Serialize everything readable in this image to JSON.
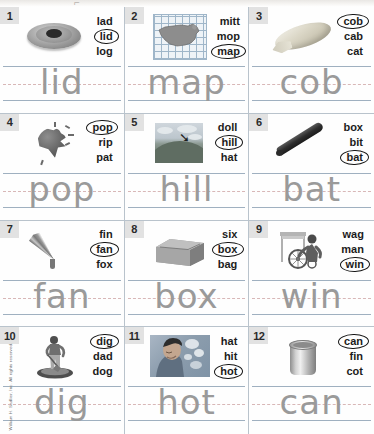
{
  "worksheet": {
    "copyright": "William H. Sadlier, Inc.  All rights reserved.",
    "row_colors": {
      "rule_line": "#9fb0c0",
      "dashed_mid_line": "#d8b7b7",
      "cell_border": "#b9c3cc",
      "trace_letter": "#9a9a9a",
      "number_badge_bg": "#e2e2e2"
    },
    "items": [
      {
        "number": "1",
        "picture": "lid-icon",
        "choices": [
          "lad",
          "lid",
          "log"
        ],
        "answer": "lid",
        "traced_word": "lid"
      },
      {
        "number": "2",
        "picture": "usa-map-icon",
        "choices": [
          "mitt",
          "mop",
          "map"
        ],
        "answer": "map",
        "traced_word": "map"
      },
      {
        "number": "3",
        "picture": "corn-cob-icon",
        "choices": [
          "cob",
          "cab",
          "cat"
        ],
        "answer": "cob",
        "traced_word": "cob"
      },
      {
        "number": "4",
        "picture": "popping-balloon-icon",
        "choices": [
          "pop",
          "rip",
          "pat"
        ],
        "answer": "pop",
        "traced_word": "pop"
      },
      {
        "number": "5",
        "picture": "hill-landscape-icon",
        "choices": [
          "doll",
          "hill",
          "hat"
        ],
        "answer": "hill",
        "traced_word": "hill"
      },
      {
        "number": "6",
        "picture": "baseball-bat-icon",
        "choices": [
          "box",
          "bit",
          "bat"
        ],
        "answer": "bat",
        "traced_word": "bat"
      },
      {
        "number": "7",
        "picture": "hand-fan-icon",
        "choices": [
          "fin",
          "fan",
          "fox"
        ],
        "answer": "fan",
        "traced_word": "fan"
      },
      {
        "number": "8",
        "picture": "cardboard-box-icon",
        "choices": [
          "six",
          "box",
          "bag"
        ],
        "answer": "box",
        "traced_word": "box"
      },
      {
        "number": "9",
        "picture": "wheelchair-racer-icon",
        "choices": [
          "wag",
          "man",
          "win"
        ],
        "answer": "win",
        "traced_word": "win"
      },
      {
        "number": "10",
        "picture": "digging-person-icon",
        "choices": [
          "dig",
          "dad",
          "dog"
        ],
        "answer": "dig",
        "traced_word": "dig"
      },
      {
        "number": "11",
        "picture": "hot-person-icon",
        "choices": [
          "hat",
          "hit",
          "hot"
        ],
        "answer": "hot",
        "traced_word": "hot"
      },
      {
        "number": "12",
        "picture": "tin-can-icon",
        "choices": [
          "can",
          "fin",
          "cot"
        ],
        "answer": "can",
        "traced_word": "can"
      }
    ]
  }
}
